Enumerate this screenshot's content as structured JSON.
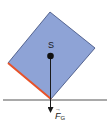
{
  "diagram": {
    "type": "physics-free-body",
    "block": {
      "shape": "tilted-square",
      "fill": "#8ea3d6",
      "stroke": "#3a4a7a",
      "corners": {
        "top": [
          50,
          12
        ],
        "right": [
          95,
          48
        ],
        "bottom": [
          51,
          99
        ],
        "left": [
          8,
          63
        ]
      },
      "highlighted_edge": {
        "from": "left",
        "to": "bottom",
        "color": "#e8532a"
      }
    },
    "center_of_gravity": {
      "label": "S",
      "position": [
        50,
        56
      ]
    },
    "force": {
      "label": "F",
      "subscript": "G",
      "vector_arrow": "→",
      "direction": "down",
      "color": "#1a1a1a"
    },
    "ground": {
      "color": "#555555"
    }
  }
}
